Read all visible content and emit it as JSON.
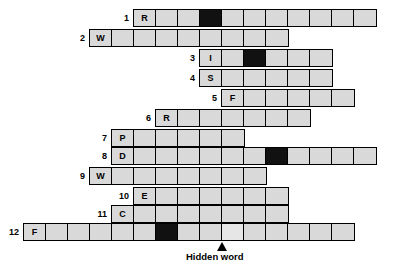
{
  "puzzle": {
    "title": "Crossword grid with hidden word",
    "cell_size": 22,
    "cell_height": 18,
    "colors": {
      "cell_fill": "#d9d9d9",
      "blocked_fill": "#111111",
      "border": "#000000",
      "background": "#ffffff",
      "highlight_fill": "#e6e6e6"
    },
    "rows": [
      {
        "number": "1",
        "x": 133,
        "y": 9,
        "count": 11,
        "letters": [
          "R",
          "",
          "",
          "",
          "",
          "",
          "",
          "",
          "",
          "",
          ""
        ],
        "blocked": [
          3
        ],
        "highlight": []
      },
      {
        "number": "2",
        "x": 89,
        "y": 29,
        "count": 9,
        "letters": [
          "W",
          "",
          "",
          "",
          "",
          "",
          "",
          "",
          ""
        ],
        "blocked": [],
        "highlight": []
      },
      {
        "number": "3",
        "x": 199,
        "y": 49,
        "count": 6,
        "letters": [
          "I",
          "",
          "",
          "",
          "",
          ""
        ],
        "blocked": [
          2
        ],
        "highlight": []
      },
      {
        "number": "4",
        "x": 199,
        "y": 69,
        "count": 6,
        "letters": [
          "S",
          "",
          "",
          "",
          "",
          ""
        ],
        "blocked": [],
        "highlight": []
      },
      {
        "number": "5",
        "x": 221,
        "y": 89,
        "count": 6,
        "letters": [
          "F",
          "",
          "",
          "",
          "",
          ""
        ],
        "blocked": [],
        "highlight": []
      },
      {
        "number": "6",
        "x": 155,
        "y": 109,
        "count": 7,
        "letters": [
          "R",
          "",
          "",
          "",
          "",
          "",
          ""
        ],
        "blocked": [],
        "highlight": []
      },
      {
        "number": "7",
        "x": 111,
        "y": 129,
        "count": 6,
        "letters": [
          "P",
          "",
          "",
          "",
          "",
          ""
        ],
        "blocked": [],
        "highlight": []
      },
      {
        "number": "8",
        "x": 111,
        "y": 147,
        "count": 12,
        "letters": [
          "D",
          "",
          "",
          "",
          "",
          "",
          "",
          "",
          "",
          "",
          "",
          ""
        ],
        "blocked": [
          7
        ],
        "highlight": []
      },
      {
        "number": "9",
        "x": 89,
        "y": 167,
        "count": 8,
        "letters": [
          "W",
          "",
          "",
          "",
          "",
          "",
          "",
          ""
        ],
        "blocked": [],
        "highlight": []
      },
      {
        "number": "10",
        "x": 133,
        "y": 187,
        "count": 7,
        "letters": [
          "E",
          "",
          "",
          "",
          "",
          "",
          ""
        ],
        "blocked": [],
        "highlight": []
      },
      {
        "number": "11",
        "x": 111,
        "y": 205,
        "count": 8,
        "letters": [
          "C",
          "",
          "",
          "",
          "",
          "",
          "",
          ""
        ],
        "blocked": [],
        "highlight": []
      },
      {
        "number": "12",
        "x": 23,
        "y": 223,
        "count": 15,
        "letters": [
          "F",
          "",
          "",
          "",
          "",
          "",
          "",
          "",
          "",
          "",
          "",
          "",
          "",
          "",
          ""
        ],
        "blocked": [
          6
        ],
        "highlight": [
          9
        ]
      }
    ]
  },
  "hidden_word": {
    "label": "Hidden word",
    "arrow_x": 217,
    "arrow_y": 242,
    "label_x": 186,
    "label_y": 251
  }
}
